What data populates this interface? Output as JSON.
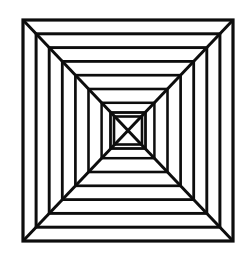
{
  "document": {
    "title": "Nested Concentric Squares Illusion",
    "background_color": "#ffffff",
    "stroke_color": "#0d0d0d",
    "width": 248,
    "height": 276
  },
  "figure": {
    "name": "concentric-squares-tunnel",
    "stroke_color": "#0d0d0d",
    "fill": "none",
    "center": {
      "x": 128,
      "y": 130.5
    },
    "outer_bounds": {
      "left": 23,
      "top": 20,
      "right": 233,
      "bottom": 241
    },
    "square_count": 9,
    "diagonal_count": 4,
    "squares": [
      {
        "index": 0,
        "left": 23,
        "top": 20,
        "right": 233,
        "bottom": 241,
        "stroke_width": 3.2
      },
      {
        "index": 1,
        "left": 36.1,
        "top": 33.8,
        "right": 219.9,
        "bottom": 227.2,
        "stroke_width": 3.0
      },
      {
        "index": 2,
        "left": 49.2,
        "top": 47.6,
        "right": 206.8,
        "bottom": 213.4,
        "stroke_width": 2.9
      },
      {
        "index": 3,
        "left": 62.3,
        "top": 61.4,
        "right": 193.7,
        "bottom": 199.6,
        "stroke_width": 2.8
      },
      {
        "index": 4,
        "left": 75.4,
        "top": 75.2,
        "right": 180.6,
        "bottom": 185.8,
        "stroke_width": 2.7
      },
      {
        "index": 5,
        "left": 88.5,
        "top": 89.0,
        "right": 167.5,
        "bottom": 172.0,
        "stroke_width": 2.6
      },
      {
        "index": 6,
        "left": 101.6,
        "top": 102.8,
        "right": 154.4,
        "bottom": 158.2,
        "stroke_width": 2.5
      },
      {
        "index": 7,
        "left": 110.5,
        "top": 112.5,
        "right": 145.5,
        "bottom": 148.5,
        "stroke_width": 2.8
      },
      {
        "index": 8,
        "left": 114.0,
        "top": 116.5,
        "right": 142.0,
        "bottom": 144.5,
        "stroke_width": 2.6
      }
    ],
    "diagonals": [
      {
        "name": "top-left-to-center",
        "x1": 23,
        "y1": 20,
        "x2": 128,
        "y2": 130.5,
        "stroke_width": 3.0
      },
      {
        "name": "top-right-to-center",
        "x1": 233,
        "y1": 20,
        "x2": 128,
        "y2": 130.5,
        "stroke_width": 3.0
      },
      {
        "name": "bottom-right-to-center",
        "x1": 233,
        "y1": 241,
        "x2": 128,
        "y2": 130.5,
        "stroke_width": 3.0
      },
      {
        "name": "bottom-left-to-center",
        "x1": 23,
        "y1": 241,
        "x2": 128,
        "y2": 130.5,
        "stroke_width": 3.0
      }
    ]
  }
}
